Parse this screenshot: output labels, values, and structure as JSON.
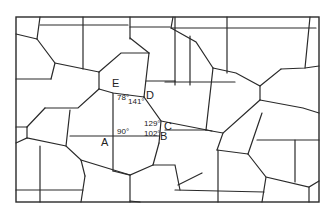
{
  "points": [
    {
      "id": "A",
      "label": "A",
      "x": 104,
      "y": 138
    },
    {
      "id": "B",
      "label": "B",
      "x": 160,
      "y": 137
    },
    {
      "id": "C",
      "label": "C",
      "x": 164,
      "y": 128
    },
    {
      "id": "D",
      "label": "D",
      "x": 146,
      "y": 91
    },
    {
      "id": "E",
      "label": "E",
      "x": 112,
      "y": 79
    }
  ],
  "angles": [
    {
      "label": "78°",
      "x": 117,
      "y": 94
    },
    {
      "label": "141°",
      "x": 128,
      "y": 97
    },
    {
      "label": "129°",
      "x": 143,
      "y": 119
    },
    {
      "label": "102°",
      "x": 143,
      "y": 129
    },
    {
      "label": "90°",
      "x": 116,
      "y": 127
    }
  ],
  "stroke_color": "#2a2a2a",
  "background_color": "#ffffff"
}
